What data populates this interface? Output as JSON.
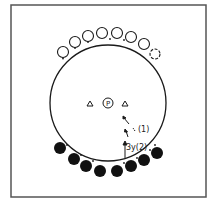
{
  "diagram": {
    "center_label": "P",
    "arrow_labels": {
      "upper": "(1)",
      "lower": "3y(2)"
    },
    "open_circles_count": 8,
    "filled_circles_count": 8,
    "triangles_count": 2,
    "colors": {
      "stroke": "#1a1a1a",
      "fill_dark": "#111111",
      "background": "#ffffff",
      "frame": "#555555"
    }
  }
}
